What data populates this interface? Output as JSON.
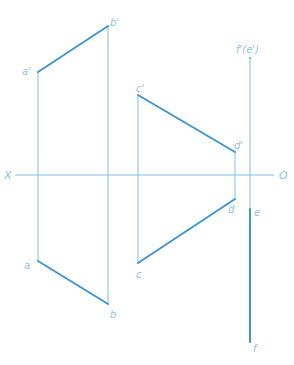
{
  "diagram": {
    "type": "orthographic projection",
    "colors": {
      "thin_line": "#7fc0e6",
      "thick_line": "#3f95d3",
      "label": "#8fc3e3",
      "background": "#ffffff"
    },
    "axis": {
      "left_label": "X",
      "right_label": "O",
      "y": 175,
      "x1": 15,
      "x2": 274
    },
    "labels": {
      "a_prime": "a'",
      "b_prime": "b'",
      "c_prime": "c'",
      "d_prime": "d'",
      "fe_prime": "f'(e')",
      "a": "a",
      "b": "b",
      "c": "c",
      "d": "d",
      "e": "e",
      "f": "f"
    },
    "points": {
      "a_prime": [
        38,
        72
      ],
      "b_prime": [
        108,
        26
      ],
      "c_prime": [
        138,
        95
      ],
      "d_prime": [
        235,
        152
      ],
      "fe_prime": [
        250,
        58
      ],
      "a": [
        38,
        261
      ],
      "b": [
        108,
        304
      ],
      "c": [
        138,
        263
      ],
      "d": [
        235,
        199
      ],
      "e": [
        250,
        209
      ],
      "f": [
        250,
        342
      ]
    },
    "segments": [
      {
        "name": "a'b'",
        "from": "a_prime",
        "to": "b_prime",
        "weight": "thick"
      },
      {
        "name": "ab",
        "from": "a",
        "to": "b",
        "weight": "thick"
      },
      {
        "name": "c'd'",
        "from": "c_prime",
        "to": "d_prime",
        "weight": "thick"
      },
      {
        "name": "cd",
        "from": "c",
        "to": "d",
        "weight": "thick"
      },
      {
        "name": "ef",
        "from": "e",
        "to": "f",
        "weight": "thick"
      }
    ]
  }
}
